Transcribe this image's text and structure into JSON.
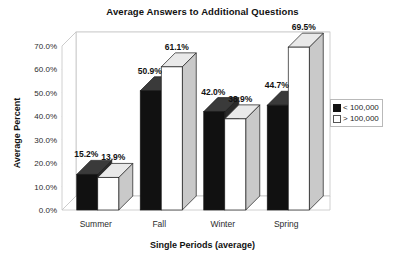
{
  "chart_data": {
    "type": "bar",
    "title": "Average Answers to Additional Questions",
    "xlabel": "Single Periods (average)",
    "ylabel": "Average Percent",
    "categories": [
      "Summer",
      "Fall",
      "Winter",
      "Spring"
    ],
    "series": [
      {
        "name": "< 100,000",
        "values": [
          15.2,
          50.9,
          42.0,
          44.7
        ],
        "labels": [
          "15.2%",
          "50.9%",
          "42.0%",
          "44.7%"
        ],
        "color": "#111111",
        "style": "filled"
      },
      {
        "name": "> 100,000",
        "values": [
          13.9,
          61.1,
          38.9,
          69.5
        ],
        "labels": [
          "13.9%",
          "61.1%",
          "38.9%",
          "69.5%"
        ],
        "color": "#ffffff",
        "style": "hollow"
      }
    ],
    "ylim": [
      0,
      70
    ],
    "ytick_labels": [
      "70.0%",
      "60.0%",
      "50.0%",
      "40.0%",
      "30.0%",
      "20.0%",
      "10.0%",
      "0.0%"
    ],
    "ytick_values": [
      70,
      60,
      50,
      40,
      30,
      20,
      10,
      0
    ],
    "grid": true,
    "grid_axis": "y",
    "legend_position": "right",
    "projection": "3d-column",
    "units": "percent"
  },
  "legend": {
    "entries": [
      {
        "label": "< 100,000",
        "swatch": "filled-square-icon"
      },
      {
        "label": "> 100,000",
        "swatch": "hollow-square-icon"
      }
    ]
  }
}
